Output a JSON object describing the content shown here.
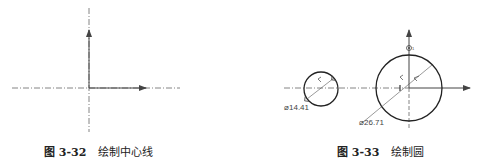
{
  "figures": [
    {
      "id": "left",
      "caption": {
        "number": "图 3-32",
        "title": "绘制中心线"
      }
    },
    {
      "id": "right",
      "caption": {
        "number": "图 3-33",
        "title": "绘制圆"
      },
      "dimensions": {
        "small_circle": "⌀14.41",
        "large_circle": "⌀26.71"
      }
    }
  ],
  "colors": {
    "line": "#333333",
    "centerline": "#555555"
  }
}
